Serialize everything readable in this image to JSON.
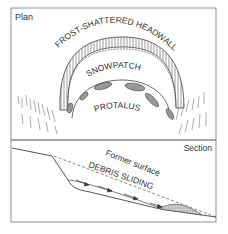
{
  "plan": {
    "title": "Plan",
    "labels": {
      "headwall": "FROST-SHATTERED HEADWALL",
      "snowpatch": "SNOWPATCH",
      "protalus": "PROTALUS"
    }
  },
  "section": {
    "title": "Section",
    "labels": {
      "former_surface": "Former surface",
      "debris_sliding": "DEBRIS SLIDING"
    }
  },
  "colors": {
    "line": "#444444",
    "frame": "#777777",
    "debris_fill": "#999999"
  }
}
